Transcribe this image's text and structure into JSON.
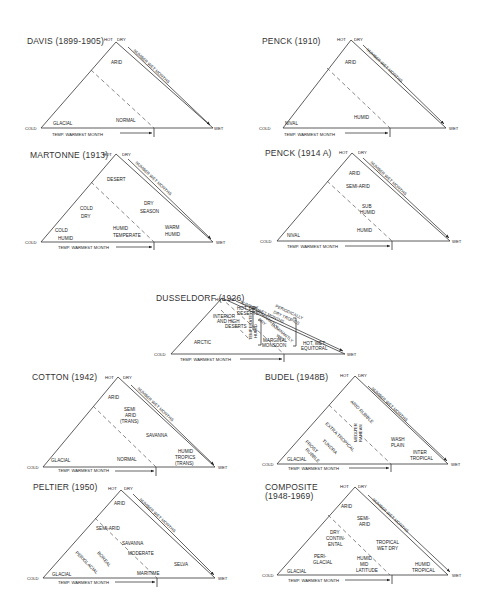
{
  "common": {
    "hot": "HOT",
    "dry": "DRY",
    "cold": "COLD",
    "wet": "WET",
    "x_axis": "TEMP. WARMEST MONTH",
    "side_axis": "NUMBER WET MONTHS"
  },
  "diagrams": {
    "davis": {
      "title": "DAVIS (1899-1905)",
      "zones": {
        "z1": "ARID",
        "z2": "GLACIAL",
        "z3": "NORMAL"
      }
    },
    "penck1910": {
      "title": "PENCK (1910)",
      "zones": {
        "z1": "ARID",
        "z2": "NIVAL",
        "z3": "HUMID"
      }
    },
    "martonne": {
      "title": "MARTONNE (1913)",
      "zones": {
        "z1": "DESERT",
        "z2a": "COLD",
        "z2b": "DRY",
        "z3a": "DRY",
        "z3b": "SEASON",
        "z4a": "COLD",
        "z4b": "HUMID",
        "z5a": "HUMID",
        "z5b": "TEMPERATE",
        "z6a": "WARM",
        "z6b": "HUMID"
      }
    },
    "penck1914": {
      "title": "PENCK (1914 A)",
      "zones": {
        "z1": "ARID",
        "z2": "SEMI-ARID",
        "z3a": "SUB",
        "z3b": "HUMID",
        "z4": "HUMID",
        "z5": "NIVAL"
      }
    },
    "dusseldorf": {
      "title": "DUSSELDORF (1926)",
      "zones": {
        "z1a": "HOT, DRY,",
        "z1b": "DESERTS",
        "z2a": "INTERIOR",
        "z2b": "AND HIGH",
        "z2c": "DESERTS",
        "z3a": "PERIODICALLY",
        "z3b": "DRY TROPICS",
        "z4a": "DOMINANTLY",
        "z4b": "DRY",
        "z5a": "DOMINANTLY",
        "z5b": "WET",
        "z6a": "TEMPERATE",
        "z6b": "HUMID",
        "z7": "ARCTIC",
        "z8a": "MARGINAL",
        "z8b": "MONSOON",
        "z9a": "HOT, WET,",
        "z9b": "EQUITORAL"
      }
    },
    "cotton": {
      "title": "COTTON (1942)",
      "zones": {
        "z1": "ARID",
        "z2a": "SEMI",
        "z2b": "ARID",
        "z2c": "(TRANS)",
        "z3": "SAVANNA",
        "z4": "GLACIAL",
        "z5": "NORMAL",
        "z6a": "HUMID",
        "z6b": "TROPICS",
        "z6c": "(TRANS)"
      }
    },
    "budel": {
      "title": "BUDEL (1948B)",
      "zones": {
        "z1": "ARID RUBBLE",
        "z2a": "MEDITER",
        "z2b": "RANEAN",
        "z3": "EXTRA TROPICAL",
        "z4": "TUNDRA",
        "z5a": "FROST",
        "z5b": "RUBBLE",
        "z6": "GLACIAL",
        "z7a": "WASH",
        "z7b": "PLAIN",
        "z8a": "INTER",
        "z8b": "TROPICAL"
      }
    },
    "peltier": {
      "title": "PELTIER (1950)",
      "zones": {
        "z1": "ARID",
        "z2": "SEMI-ARID",
        "z3": "SAVANNA",
        "z4": "MODERATE",
        "z5": "BOREAL",
        "z6": "PERIGLACIAL",
        "z7": "GLACIAL",
        "z8": "MARITIME",
        "z9": "SELVA"
      }
    },
    "composite": {
      "title_line1": "COMPOSITE",
      "title_line2": "(1948-1969)",
      "zones": {
        "z1": "ARID",
        "z2a": "SEMI-",
        "z2b": "ARID",
        "z3a": "DRY",
        "z3b": "CONTIN-",
        "z3c": "ENTAL",
        "z4a": "TROPICAL",
        "z4b": "WET DRY",
        "z5a": "PERI-",
        "z5b": "GLACIAL",
        "z6a": "HUMID",
        "z6b": "MID",
        "z6c": "LATITUDE",
        "z7": "GLACIAL",
        "z8a": "HUMID",
        "z8b": "TROPICAL"
      }
    }
  }
}
